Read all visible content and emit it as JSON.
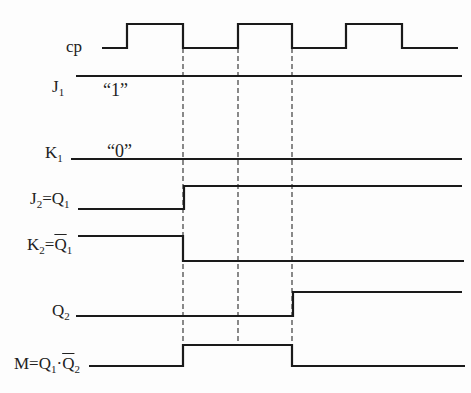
{
  "diagram": {
    "type": "timing-diagram",
    "colors": {
      "line": "#1a1a1a",
      "background": "#fdfdfd"
    },
    "signals": [
      {
        "id": "cp",
        "label": "cp",
        "sub": "",
        "eq": "",
        "eq_sub": "",
        "overline": false,
        "points": [
          [
            102,
            48
          ],
          [
            127,
            48
          ],
          [
            127,
            24
          ],
          [
            183,
            24
          ],
          [
            183,
            48
          ],
          [
            238,
            48
          ],
          [
            238,
            24
          ],
          [
            292,
            24
          ],
          [
            292,
            48
          ],
          [
            346,
            48
          ],
          [
            346,
            24
          ],
          [
            402,
            24
          ],
          [
            402,
            48
          ],
          [
            458,
            48
          ]
        ],
        "label_x": 66,
        "label_y": 38
      },
      {
        "id": "J1",
        "label": "J",
        "sub": "1",
        "eq": "",
        "eq_sub": "",
        "overline": false,
        "points": [
          [
            76,
            76
          ],
          [
            462,
            76
          ]
        ],
        "label_x": 52,
        "label_y": 78
      },
      {
        "id": "K1",
        "label": "K",
        "sub": "1",
        "eq": "",
        "eq_sub": "",
        "overline": false,
        "points": [
          [
            71,
            159
          ],
          [
            462,
            159
          ]
        ],
        "label_x": 45,
        "label_y": 144
      },
      {
        "id": "J2",
        "label": "J",
        "sub": "2",
        "eq": "=Q",
        "eq_sub": "1",
        "overline": false,
        "points": [
          [
            78,
            209
          ],
          [
            184,
            209
          ],
          [
            184,
            186
          ],
          [
            462,
            186
          ]
        ],
        "label_x": 30,
        "label_y": 190
      },
      {
        "id": "K2",
        "label": "K",
        "sub": "2",
        "eq": "=Q",
        "eq_sub": "1",
        "overline": true,
        "points": [
          [
            78,
            236
          ],
          [
            183,
            236
          ],
          [
            183,
            261
          ],
          [
            464,
            261
          ]
        ],
        "label_x": 27,
        "label_y": 236
      },
      {
        "id": "Q2",
        "label": "Q",
        "sub": "2",
        "eq": "",
        "eq_sub": "",
        "overline": false,
        "points": [
          [
            76,
            316
          ],
          [
            293,
            316
          ],
          [
            293,
            292
          ],
          [
            462,
            292
          ]
        ],
        "label_x": 52,
        "label_y": 302
      },
      {
        "id": "M",
        "label": "M=Q",
        "sub": "1",
        "eq": "·Q",
        "eq_sub": "2",
        "overline": true,
        "points": [
          [
            89,
            366
          ],
          [
            183,
            366
          ],
          [
            183,
            345
          ],
          [
            292,
            345
          ],
          [
            292,
            366
          ],
          [
            465,
            366
          ]
        ],
        "label_x": 14,
        "label_y": 355
      }
    ],
    "guides": [
      {
        "x": 183,
        "y1": 48,
        "y2": 366
      },
      {
        "x": 238,
        "y1": 48,
        "y2": 345
      },
      {
        "x": 292,
        "y1": 48,
        "y2": 345
      }
    ],
    "annotations": [
      {
        "id": "j1-value",
        "text": "“1”",
        "x": 103,
        "y": 80
      },
      {
        "id": "k1-value",
        "text": "“0”",
        "x": 107,
        "y": 141
      }
    ]
  }
}
